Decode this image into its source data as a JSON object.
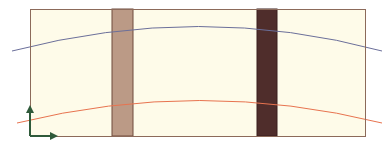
{
  "diagram": {
    "background": "#ffffff",
    "panel": {
      "x": 30,
      "y": 9,
      "width": 335,
      "height": 127,
      "fill": "#fefbe9",
      "stroke": "#8c6a5a"
    },
    "bars": [
      {
        "name": "light-bar",
        "x": 112,
        "width": 21,
        "fill": "#bb9a86",
        "stroke": "#6e4b3c"
      },
      {
        "name": "dark-bar",
        "x": 257,
        "width": 20,
        "fill": "#4f2d2b",
        "stroke": "#3a1f1e"
      }
    ],
    "curves": [
      {
        "name": "upper-curve",
        "color": "#6b6f9a",
        "path": "M12,51 Q200,2 382,51"
      },
      {
        "name": "lower-curve",
        "color": "#e8734f",
        "path": "M17,123 Q200,78 382,123"
      }
    ],
    "axes": {
      "color": "#2f5a3a",
      "origin": [
        30,
        136
      ],
      "x_end": 58,
      "y_end": 105
    }
  }
}
